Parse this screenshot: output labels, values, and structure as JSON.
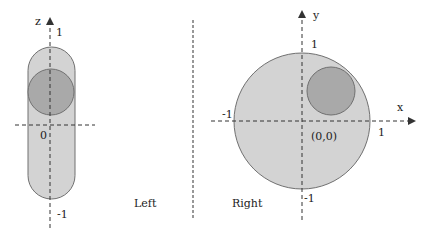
{
  "colors": {
    "outer_fill": "#d3d3d3",
    "inner_fill": "#a9a9a9",
    "stroke": "#707070",
    "axis": "#333333"
  },
  "left": {
    "caption": "Left",
    "axis_label": "z",
    "tick_top": "1",
    "tick_origin": "0",
    "tick_bottom": "-1"
  },
  "right": {
    "caption": "Right",
    "x_axis_label": "x",
    "y_axis_label": "y",
    "tick_y_top": "1",
    "tick_y_bottom": "-1",
    "tick_x_left": "-1",
    "tick_x_right": "1",
    "origin_label": "(0,0)"
  }
}
